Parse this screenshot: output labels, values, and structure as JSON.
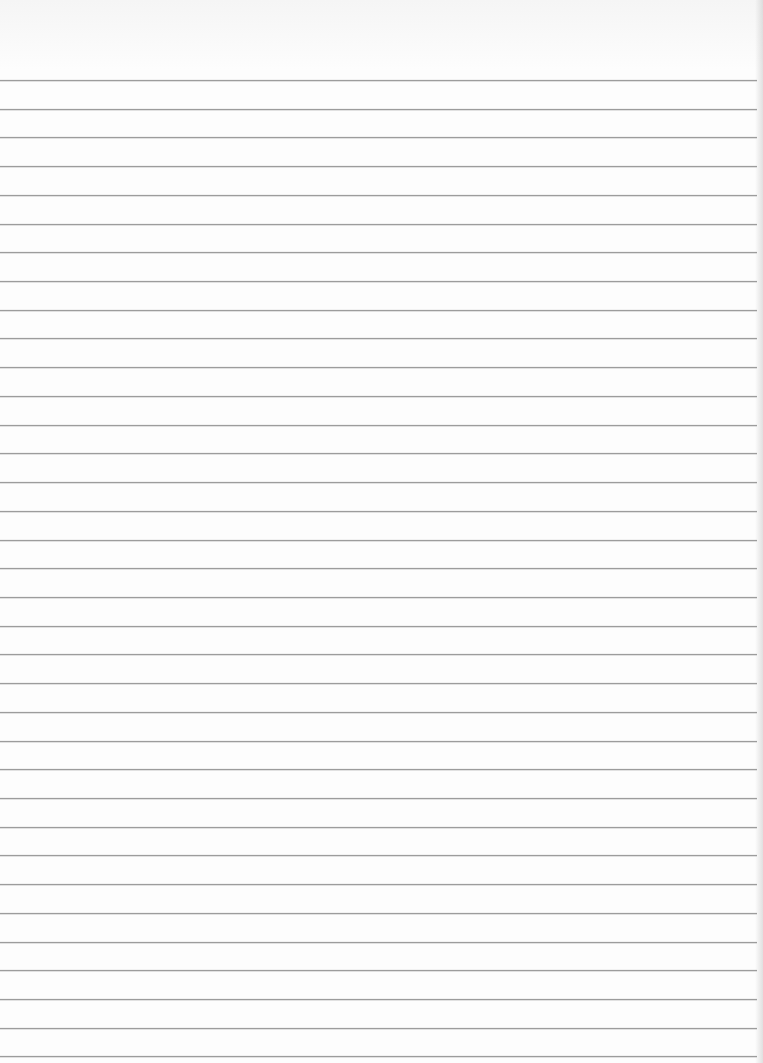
{
  "page": {
    "type": "lined-paper",
    "background_color": "#fdfdfd",
    "rule_color": "#9c9c9c",
    "first_rule_y": 80,
    "rule_spacing": 28.72,
    "rule_count": 35,
    "text_content": ""
  }
}
